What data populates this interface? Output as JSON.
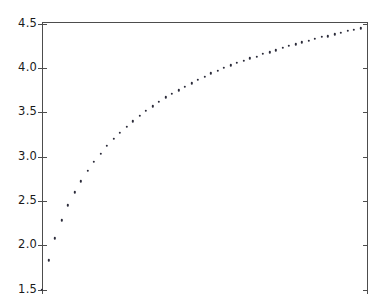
{
  "chart_data": {
    "type": "scatter",
    "title": "",
    "xlabel": "",
    "ylabel": "",
    "marker": "point",
    "marker_color": "#2b2b3a",
    "grid": false,
    "legend": null,
    "ylim": [
      1.45,
      4.52
    ],
    "yticks": [
      1.5,
      2.0,
      2.5,
      3.0,
      3.5,
      4.0,
      4.5
    ],
    "ytick_labels": [
      "1.5",
      "2.0",
      "2.5",
      "3.0",
      "3.5",
      "4.0",
      "4.5"
    ],
    "xlim": [
      0.0,
      50.0
    ],
    "xticks": [],
    "xtick_labels": [],
    "x": [
      0,
      1,
      2,
      3,
      4,
      5,
      6,
      7,
      8,
      9,
      10,
      11,
      12,
      13,
      14,
      15,
      16,
      17,
      18,
      19,
      20,
      21,
      22,
      23,
      24,
      25,
      26,
      27,
      28,
      29,
      30,
      31,
      32,
      33,
      34,
      35,
      36,
      37,
      38,
      39,
      40,
      41,
      42,
      43,
      44,
      45,
      46,
      47,
      48,
      49
    ],
    "values": [
      1.5,
      1.83,
      2.08,
      2.28,
      2.45,
      2.6,
      2.72,
      2.84,
      2.94,
      3.03,
      3.12,
      3.2,
      3.27,
      3.34,
      3.4,
      3.46,
      3.52,
      3.57,
      3.62,
      3.67,
      3.71,
      3.75,
      3.79,
      3.83,
      3.87,
      3.9,
      3.94,
      3.97,
      4.0,
      4.03,
      4.06,
      4.08,
      4.11,
      4.13,
      4.16,
      4.18,
      4.2,
      4.23,
      4.25,
      4.27,
      4.29,
      4.31,
      4.33,
      4.35,
      4.36,
      4.38,
      4.4,
      4.42,
      4.43,
      4.45
    ]
  },
  "axes": {
    "spine_color": "#4d4d4d",
    "background": "#ffffff"
  }
}
